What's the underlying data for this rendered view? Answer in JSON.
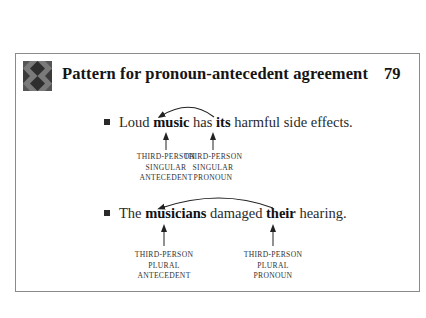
{
  "header": {
    "icon": "argyle-pattern-icon",
    "title": "Pattern for pronoun-antecedent agreement",
    "page_number": "79"
  },
  "examples": [
    {
      "bullet": "square-bullet",
      "parts": [
        "Loud ",
        "music",
        " has ",
        "its",
        " harmful side effects."
      ],
      "bold_parts": [
        "music",
        "its"
      ],
      "labels": [
        {
          "lines": [
            "THIRD-PERSON",
            "SINGULAR",
            "ANTECEDENT"
          ]
        },
        {
          "lines": [
            "THIRD-PERSON",
            "SINGULAR",
            "PRONOUN"
          ]
        }
      ]
    },
    {
      "bullet": "square-bullet",
      "parts": [
        "The ",
        "musicians",
        " damaged ",
        "their",
        " hearing."
      ],
      "bold_parts": [
        "musicians",
        "their"
      ],
      "labels": [
        {
          "lines": [
            "THIRD-PERSON",
            "PLURAL",
            "ANTECEDENT"
          ]
        },
        {
          "lines": [
            "THIRD-PERSON",
            "PLURAL",
            "PRONOUN"
          ]
        }
      ]
    }
  ],
  "colors": {
    "text": "#1a1a1a",
    "frame": "#8a8a8a",
    "icon_light": "#7a7a7a",
    "icon_dark": "#2e2e2e"
  }
}
